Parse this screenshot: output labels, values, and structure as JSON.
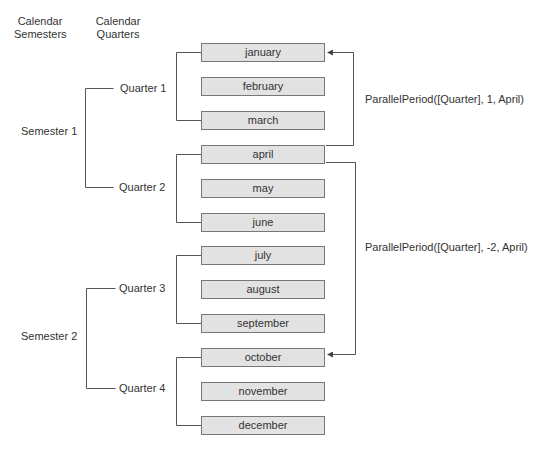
{
  "headers": {
    "semesters": "Calendar Semesters",
    "quarters": "Calendar Quarters"
  },
  "semesters": [
    {
      "label": "Semester 1"
    },
    {
      "label": "Semester 2"
    }
  ],
  "quarters": [
    {
      "label": "Quarter 1"
    },
    {
      "label": "Quarter 2"
    },
    {
      "label": "Quarter 3"
    },
    {
      "label": "Quarter 4"
    }
  ],
  "months": [
    {
      "label": "january"
    },
    {
      "label": "february"
    },
    {
      "label": "march"
    },
    {
      "label": "april"
    },
    {
      "label": "may"
    },
    {
      "label": "june"
    },
    {
      "label": "july"
    },
    {
      "label": "august"
    },
    {
      "label": "september"
    },
    {
      "label": "october"
    },
    {
      "label": "november"
    },
    {
      "label": "december"
    }
  ],
  "annotations": {
    "forward": "ParallelPeriod([Quarter], 1, April)",
    "backward": "ParallelPeriod([Quarter], -2, April)"
  },
  "colors": {
    "box_fill": "#e2e2e2",
    "box_border": "#777777",
    "line": "#555555",
    "text": "#333333"
  }
}
